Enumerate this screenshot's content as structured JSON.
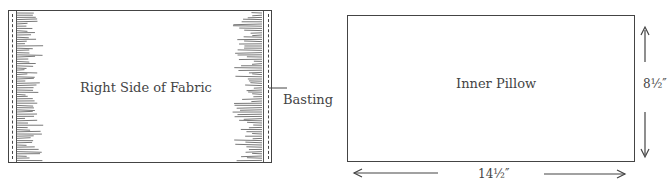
{
  "figure_left": {
    "center_label": "Right Side of Fabric",
    "callout_label": "Basting"
  },
  "figure_right": {
    "center_label": "Inner Pillow",
    "height_dimension": "8½″",
    "width_dimension": "14½″"
  }
}
